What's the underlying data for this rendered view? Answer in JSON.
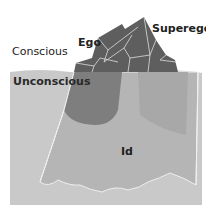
{
  "diagram": {
    "labels": {
      "conscious": "Conscious",
      "unconscious": "Unconscious",
      "ego": "Ego",
      "superego": "Superego",
      "id": "Id"
    },
    "colors": {
      "background": "#ffffff",
      "water": "#c9c9c9",
      "iceberg_above": "#5e5e5e",
      "iceberg_above_light": "#737373",
      "iceberg_below": "#a3a3a3",
      "ego_below_zone": "#7e7e7e",
      "superego_below_zone": "#b3b3b3",
      "outline": "#eeeeee"
    }
  }
}
